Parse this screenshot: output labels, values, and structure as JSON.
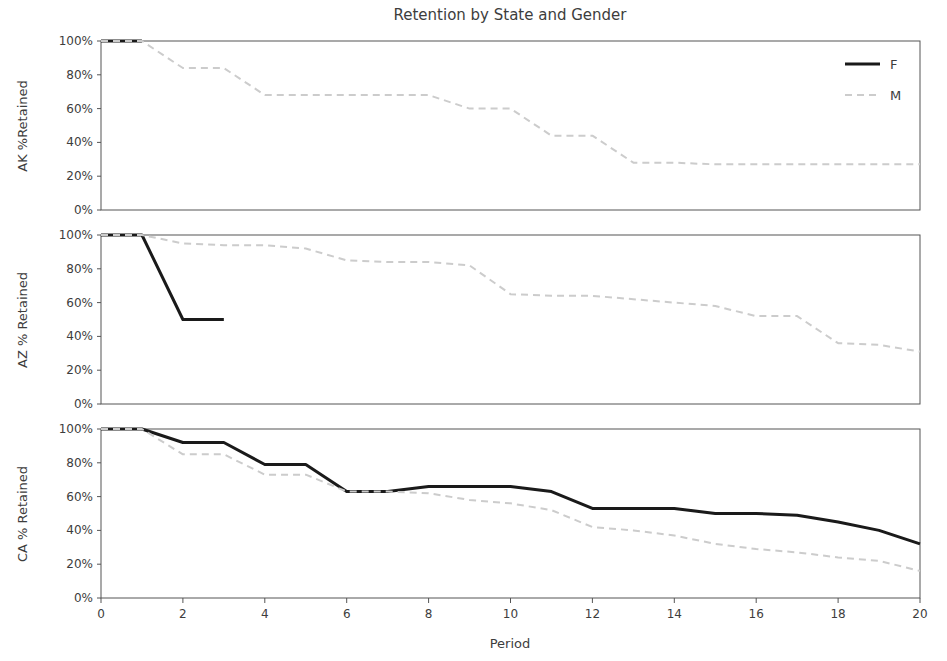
{
  "chart_data": {
    "type": "line",
    "title": "Retention by State and Gender",
    "xlabel": "Period",
    "xlim": [
      0,
      20
    ],
    "ylim": [
      0,
      100
    ],
    "grid": false,
    "legend_position": "top-right (panel 1)",
    "xticks": [
      0,
      2,
      4,
      6,
      8,
      10,
      12,
      14,
      16,
      18,
      20
    ],
    "xtick_labels": [
      "0",
      "2",
      "4",
      "6",
      "8",
      "10",
      "12",
      "14",
      "16",
      "18",
      "20"
    ],
    "yticks": [
      0,
      20,
      40,
      60,
      80,
      100
    ],
    "ytick_labels": [
      "0%",
      "20%",
      "40%",
      "60%",
      "80%",
      "100%"
    ],
    "legend": [
      {
        "name": "F",
        "style": "solid",
        "color": "#1a1a1a"
      },
      {
        "name": "M",
        "style": "dashed",
        "color": "#cccccc"
      }
    ],
    "panels": [
      {
        "state": "AK",
        "ylabel": "AK %Retained",
        "x": [
          0,
          1,
          2,
          3,
          4,
          5,
          6,
          7,
          8,
          9,
          10,
          11,
          12,
          13,
          14,
          15,
          16,
          17,
          18,
          19,
          20
        ],
        "series": [
          {
            "name": "F",
            "values": [
              100,
              100,
              null,
              null,
              null,
              null,
              null,
              null,
              null,
              null,
              null,
              null,
              null,
              null,
              null,
              null,
              null,
              null,
              null,
              null,
              null
            ]
          },
          {
            "name": "M",
            "values": [
              100,
              100,
              84,
              84,
              68,
              68,
              68,
              68,
              68,
              60,
              60,
              44,
              44,
              28,
              28,
              27,
              27,
              27,
              27,
              27,
              27
            ]
          }
        ]
      },
      {
        "state": "AZ",
        "ylabel": "AZ % Retained",
        "x": [
          0,
          1,
          2,
          3,
          4,
          5,
          6,
          7,
          8,
          9,
          10,
          11,
          12,
          13,
          14,
          15,
          16,
          17,
          18,
          19,
          20
        ],
        "series": [
          {
            "name": "F",
            "values": [
              100,
              100,
              50,
              50,
              null,
              null,
              null,
              null,
              null,
              null,
              null,
              null,
              null,
              null,
              null,
              null,
              null,
              null,
              null,
              null,
              null
            ]
          },
          {
            "name": "M",
            "values": [
              100,
              100,
              95,
              94,
              94,
              92,
              85,
              84,
              84,
              82,
              65,
              64,
              64,
              62,
              60,
              58,
              52,
              52,
              36,
              35,
              31
            ]
          }
        ]
      },
      {
        "state": "CA",
        "ylabel": "CA % Retained",
        "x": [
          0,
          1,
          2,
          3,
          4,
          5,
          6,
          7,
          8,
          9,
          10,
          11,
          12,
          13,
          14,
          15,
          16,
          17,
          18,
          19,
          20
        ],
        "series": [
          {
            "name": "F",
            "values": [
              100,
              100,
              92,
              92,
              79,
              79,
              63,
              63,
              66,
              66,
              66,
              63,
              53,
              53,
              53,
              50,
              50,
              49,
              45,
              40,
              32
            ]
          },
          {
            "name": "M",
            "values": [
              100,
              100,
              85,
              85,
              73,
              73,
              63,
              63,
              62,
              58,
              56,
              52,
              42,
              40,
              37,
              32,
              29,
              27,
              24,
              22,
              16
            ]
          }
        ]
      }
    ]
  }
}
